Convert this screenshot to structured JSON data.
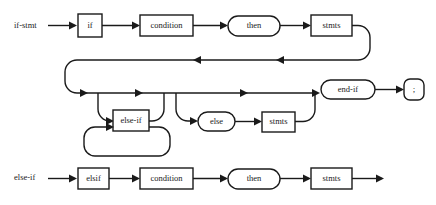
{
  "diagram": {
    "kind": "railroad-syntax-diagram",
    "title": "",
    "line_color": "#1a1a1a",
    "box_fill": "#ffffff",
    "background": "#ffffff",
    "rules": [
      {
        "id": "if-stmt",
        "name": "if-stmt",
        "nodes": [
          {
            "id": "kw-if",
            "label": "if",
            "shape": "box"
          },
          {
            "id": "condition-1",
            "label": "condition",
            "shape": "box"
          },
          {
            "id": "then-1",
            "label": "then",
            "shape": "oval"
          },
          {
            "id": "stmts-1",
            "label": "stmts",
            "shape": "box"
          },
          {
            "id": "else-if",
            "label": "else-if",
            "shape": "box"
          },
          {
            "id": "else",
            "label": "else",
            "shape": "oval"
          },
          {
            "id": "stmts-2",
            "label": "stmts",
            "shape": "box"
          },
          {
            "id": "end-if",
            "label": "end-if",
            "shape": "oval"
          },
          {
            "id": "semicolon",
            "label": ";",
            "shape": "oval"
          }
        ]
      },
      {
        "id": "else-if",
        "name": "else-if",
        "nodes": [
          {
            "id": "kw-elsif",
            "label": "elsif",
            "shape": "box"
          },
          {
            "id": "condition-2",
            "label": "condition",
            "shape": "box"
          },
          {
            "id": "then-2",
            "label": "then",
            "shape": "oval"
          },
          {
            "id": "stmts-3",
            "label": "stmts",
            "shape": "box"
          }
        ]
      }
    ]
  }
}
